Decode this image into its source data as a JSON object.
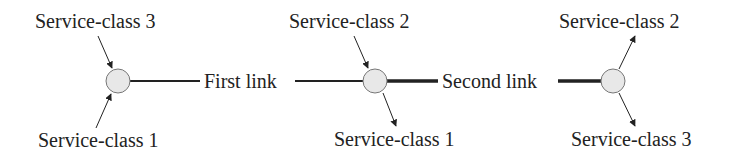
{
  "diagram": {
    "nodes": [
      {
        "id": "node-1",
        "x": 118,
        "y": 81
      },
      {
        "id": "node-2",
        "x": 375,
        "y": 81
      },
      {
        "id": "node-3",
        "x": 613,
        "y": 81
      }
    ],
    "links": [
      {
        "label": "First link",
        "from": "node-1",
        "to": "node-2"
      },
      {
        "label": "Second link",
        "from": "node-2",
        "to": "node-3"
      }
    ],
    "flows": [
      {
        "label": "Service-class 3",
        "node": "node-1",
        "direction": "in",
        "position": "top"
      },
      {
        "label": "Service-class 1",
        "node": "node-1",
        "direction": "in",
        "position": "bottom"
      },
      {
        "label": "Service-class 2",
        "node": "node-2",
        "direction": "in",
        "position": "top"
      },
      {
        "label": "Service-class 1",
        "node": "node-2",
        "direction": "out",
        "position": "bottom"
      },
      {
        "label": "Service-class 2",
        "node": "node-3",
        "direction": "out",
        "position": "top"
      },
      {
        "label": "Service-class 3",
        "node": "node-3",
        "direction": "out",
        "position": "bottom"
      }
    ]
  }
}
